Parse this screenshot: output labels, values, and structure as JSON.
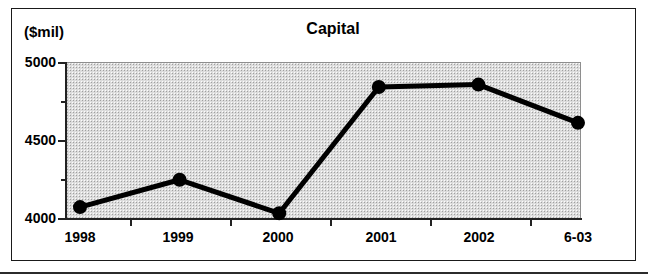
{
  "chart_data": {
    "type": "line",
    "title": "Capital",
    "xlabel": "",
    "ylabel": "($mil)",
    "unit_caption": "($mil)",
    "categories": [
      "1998",
      "1999",
      "2000",
      "2001",
      "2002",
      "6-03"
    ],
    "values": [
      4070,
      4245,
      4030,
      4840,
      4855,
      4610
    ],
    "series": [
      {
        "name": "Capital",
        "values": [
          4070,
          4245,
          4030,
          4840,
          4855,
          4610
        ]
      }
    ],
    "ylim": [
      4000,
      5000
    ],
    "ytick_labels": [
      "5000",
      "4500",
      "4000"
    ],
    "ytick_values": [
      5000,
      4500,
      4000
    ],
    "yminor_tick_values": [
      4750,
      4250
    ],
    "grid": false,
    "legend": "none",
    "plot_background": "#dcdcdc",
    "line_color": "#000000",
    "marker": "circle",
    "marker_color": "#000000",
    "frame_color": "#1a1a1a"
  }
}
